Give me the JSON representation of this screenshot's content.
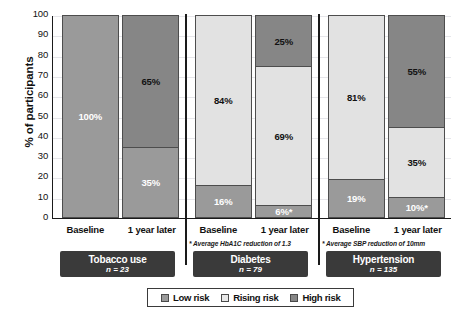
{
  "chart_data": {
    "type": "bar",
    "subtype": "stacked-100-percent",
    "title": "",
    "xlabel": "",
    "ylabel": "% of participants",
    "ylim": [
      0,
      100
    ],
    "ytick_labels": [
      "100",
      "90",
      "80",
      "70",
      "60",
      "50",
      "40",
      "30",
      "20",
      "10",
      "0"
    ],
    "ytick_values": [
      100,
      90,
      80,
      70,
      60,
      50,
      40,
      30,
      20,
      10,
      0
    ],
    "grid": true,
    "legend_position": "bottom",
    "categories": [
      "Baseline",
      "1 year later"
    ],
    "legend": [
      "Low risk",
      "Rising risk",
      "High risk"
    ],
    "groups": [
      {
        "name": "Tobacco use",
        "n_label": "n = 23",
        "footnote": "",
        "bars": [
          {
            "category": "Baseline",
            "segments": [
              {
                "series": "Low risk",
                "value": 100,
                "label": "100%"
              }
            ]
          },
          {
            "category": "1 year later",
            "segments": [
              {
                "series": "High risk",
                "value": 65,
                "label": "65%"
              },
              {
                "series": "Low risk",
                "value": 35,
                "label": "35%"
              }
            ]
          }
        ]
      },
      {
        "name": "Diabetes",
        "n_label": "n = 79",
        "footnote": "* Average HbA1C reduction of 1.3",
        "bars": [
          {
            "category": "Baseline",
            "segments": [
              {
                "series": "Rising risk",
                "value": 84,
                "label": "84%"
              },
              {
                "series": "Low risk",
                "value": 16,
                "label": "16%"
              }
            ]
          },
          {
            "category": "1 year later",
            "segments": [
              {
                "series": "High risk",
                "value": 25,
                "label": "25%"
              },
              {
                "series": "Rising risk",
                "value": 69,
                "label": "69%"
              },
              {
                "series": "Low risk",
                "value": 6,
                "label": "6%*"
              }
            ]
          }
        ]
      },
      {
        "name": "Hypertension",
        "n_label": "n = 135",
        "footnote": "* Average SBP reduction of 10mm",
        "bars": [
          {
            "category": "Baseline",
            "segments": [
              {
                "series": "Rising risk",
                "value": 81,
                "label": "81%"
              },
              {
                "series": "Low risk",
                "value": 19,
                "label": "19%"
              }
            ]
          },
          {
            "category": "1 year later",
            "segments": [
              {
                "series": "High risk",
                "value": 55,
                "label": "55%"
              },
              {
                "series": "Rising risk",
                "value": 35,
                "label": "35%"
              },
              {
                "series": "Low risk",
                "value": 10,
                "label": "10%*"
              }
            ]
          }
        ]
      }
    ],
    "colors": {
      "low_risk": "#9a9a9a",
      "rising_risk": "#e2e2e2",
      "high_risk": "#868686",
      "axis": "#1a1a1a",
      "gridline": "#e6e6ea",
      "group_badge_bg": "#3a3a3a",
      "group_badge_text": "#ffffff"
    }
  }
}
